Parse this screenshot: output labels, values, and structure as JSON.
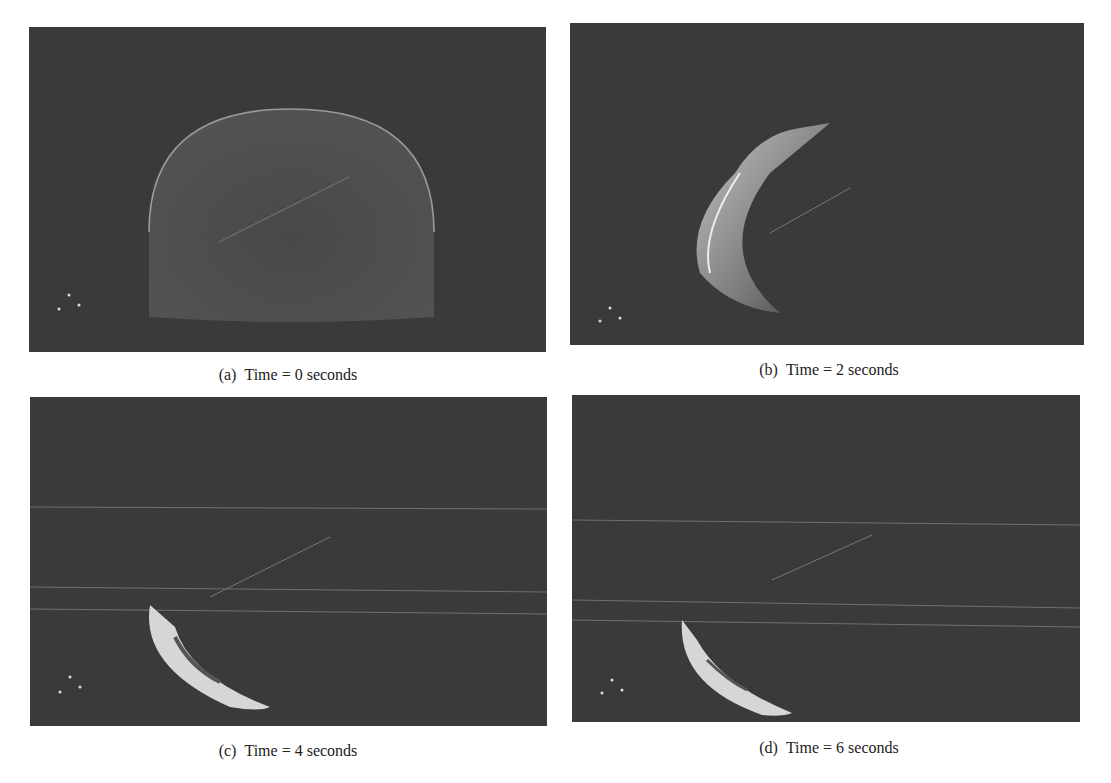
{
  "figure": {
    "panels": [
      {
        "id": "a",
        "label": "(a)",
        "caption": "Time = 0 seconds",
        "time_s": 0,
        "shape": "full-dome"
      },
      {
        "id": "b",
        "label": "(b)",
        "caption": "Time = 2 seconds",
        "time_s": 2,
        "shape": "collapsing-dome"
      },
      {
        "id": "c",
        "label": "(c)",
        "caption": "Time = 4 seconds",
        "time_s": 4,
        "shape": "crescent"
      },
      {
        "id": "d",
        "label": "(d)",
        "caption": "Time = 6 seconds",
        "time_s": 6,
        "shape": "thin-crescent"
      }
    ],
    "colors": {
      "panel_background": "#3a3a3a",
      "particle_highlight": "#f2f2f2",
      "page_background": "#ffffff"
    }
  }
}
